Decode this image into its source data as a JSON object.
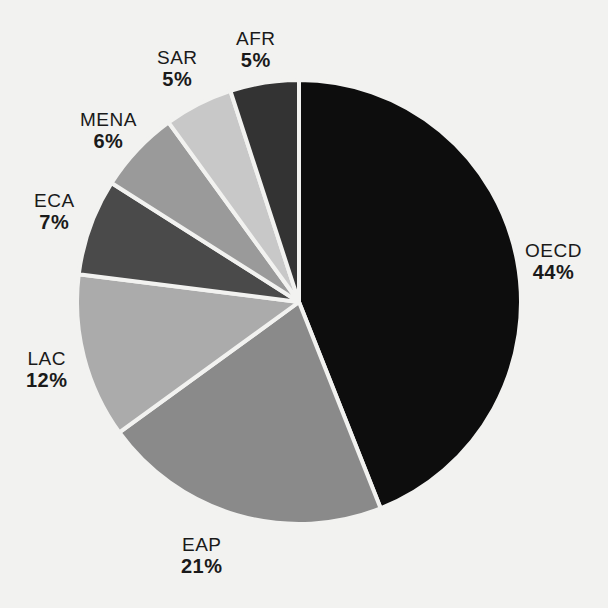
{
  "chart_data": {
    "type": "pie",
    "title": "",
    "subtitle": "",
    "xlabel": "",
    "ylabel": "",
    "legend_position": "none",
    "grid": false,
    "value_unit": "%",
    "total": 100,
    "categories": [
      "OECD",
      "EAP",
      "LAC",
      "ECA",
      "MENA",
      "SAR",
      "AFR"
    ],
    "values": [
      44,
      21,
      12,
      7,
      6,
      5,
      5
    ],
    "slices": [
      {
        "label": "OECD",
        "value": 44,
        "value_text": "44%",
        "color": "#0d0d0d",
        "start_angle": 0,
        "end_angle": 158.4
      },
      {
        "label": "EAP",
        "value": 21,
        "value_text": "21%",
        "color": "#8a8a8a",
        "start_angle": 158.4,
        "end_angle": 234.0
      },
      {
        "label": "LAC",
        "value": 12,
        "value_text": "12%",
        "color": "#ababab",
        "start_angle": 234.0,
        "end_angle": 277.2
      },
      {
        "label": "ECA",
        "value": 7,
        "value_text": "7%",
        "color": "#4a4a4a",
        "start_angle": 277.2,
        "end_angle": 302.4
      },
      {
        "label": "MENA",
        "value": 6,
        "value_text": "6%",
        "color": "#9a9a9a",
        "start_angle": 302.4,
        "end_angle": 324.0
      },
      {
        "label": "SAR",
        "value": 5,
        "value_text": "5%",
        "color": "#c8c8c8",
        "start_angle": 324.0,
        "end_angle": 342.0
      },
      {
        "label": "AFR",
        "value": 5,
        "value_text": "5%",
        "color": "#333333",
        "start_angle": 342.0,
        "end_angle": 360.0
      }
    ],
    "background_color": "#f2f2f0",
    "separator_color": "#f2f2f0",
    "label_color": "#1a1a1a",
    "center_x": 299,
    "center_y": 302,
    "radius": 222
  }
}
